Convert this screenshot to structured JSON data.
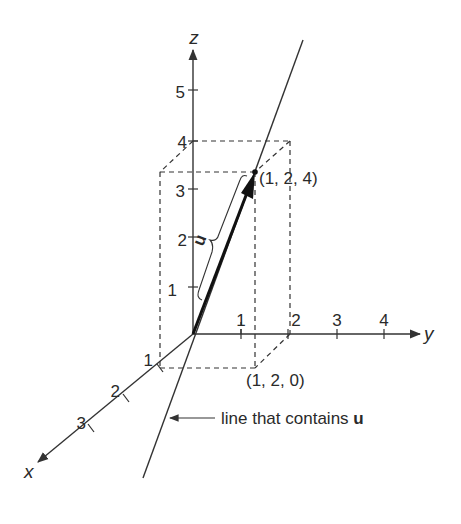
{
  "figure": {
    "axes": {
      "x": {
        "label": "x",
        "ticks": [
          "1",
          "2",
          "3"
        ]
      },
      "y": {
        "label": "y",
        "ticks": [
          "1",
          "2",
          "3",
          "4"
        ]
      },
      "z": {
        "label": "z",
        "ticks": [
          "1",
          "2",
          "3",
          "4",
          "5"
        ]
      }
    },
    "points": {
      "tip": "(1, 2, 4)",
      "base": "(1, 2, 0)"
    },
    "vector_label": "u",
    "annotation": {
      "text_prefix": "line that contains ",
      "text_bold": "u"
    }
  }
}
